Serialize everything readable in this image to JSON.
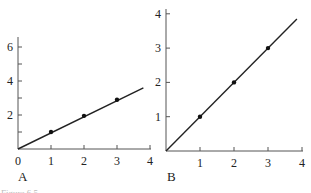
{
  "caption": "Figure 6.5",
  "chart_data": [
    {
      "type": "line",
      "panel_label": "A",
      "title": "",
      "xlabel": "",
      "ylabel": "",
      "xlim": [
        0,
        4
      ],
      "ylim": [
        0,
        6.6
      ],
      "x_ticks": [
        0,
        1,
        2,
        3,
        4
      ],
      "x_tick_labels": [
        "0",
        "1",
        "2",
        "3",
        "4"
      ],
      "y_ticks_major": [
        2,
        4,
        6
      ],
      "y_tick_labels": [
        "2",
        "4",
        "6"
      ],
      "y_ticks_minor": [
        1,
        3,
        5
      ],
      "grid": false,
      "series": [
        {
          "name": "points",
          "x": [
            1,
            2,
            3
          ],
          "y": [
            1.0,
            1.95,
            2.9
          ]
        },
        {
          "name": "fit line",
          "x": [
            0,
            3.8
          ],
          "y": [
            0,
            3.6
          ]
        }
      ]
    },
    {
      "type": "line",
      "panel_label": "B",
      "title": "",
      "xlabel": "",
      "ylabel": "",
      "xlim": [
        0,
        4
      ],
      "ylim": [
        0,
        4.1
      ],
      "x_ticks": [
        1,
        2,
        3,
        4
      ],
      "x_tick_labels": [
        "1",
        "2",
        "3",
        "4"
      ],
      "y_ticks_major": [
        1,
        2,
        3,
        4
      ],
      "y_tick_labels": [
        "1",
        "2",
        "3",
        "4"
      ],
      "grid": false,
      "series": [
        {
          "name": "points",
          "x": [
            1,
            2,
            3
          ],
          "y": [
            1,
            2,
            3
          ]
        },
        {
          "name": "fit line",
          "x": [
            0,
            3.85
          ],
          "y": [
            0,
            3.85
          ]
        }
      ]
    }
  ]
}
